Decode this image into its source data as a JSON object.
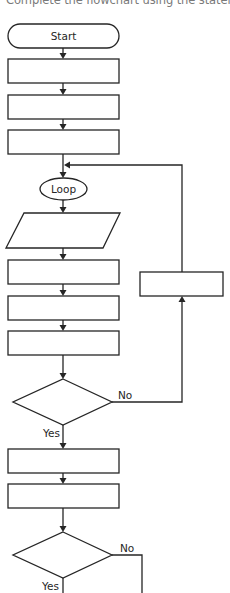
{
  "instruction": "Complete the flowchart using the statemen",
  "flowchart": {
    "start_label": "Start",
    "loop_label": "Loop",
    "decision1": {
      "no_label": "No",
      "yes_label": "Yes"
    },
    "decision2": {
      "no_label": "No",
      "yes_label": "Yes"
    },
    "boxes": [
      {
        "id": "box-1",
        "text": ""
      },
      {
        "id": "box-2",
        "text": ""
      },
      {
        "id": "box-3",
        "text": ""
      },
      {
        "id": "input-output",
        "text": ""
      },
      {
        "id": "box-4",
        "text": ""
      },
      {
        "id": "box-5",
        "text": ""
      },
      {
        "id": "box-6",
        "text": ""
      },
      {
        "id": "loop-back-box",
        "text": ""
      },
      {
        "id": "box-7",
        "text": ""
      },
      {
        "id": "box-8",
        "text": ""
      }
    ]
  },
  "colors": {
    "stroke": "#262626",
    "title": "#7a7a7a",
    "background": "#ffffff"
  }
}
